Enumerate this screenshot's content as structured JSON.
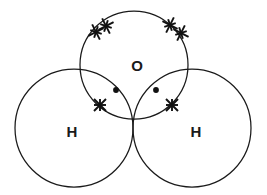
{
  "diagram": {
    "molecule": "H2O",
    "background_color": "#ffffff",
    "stroke_color": "#1a1a1a",
    "electron_color": "#111111",
    "atoms": [
      {
        "id": "oxygen",
        "label": "O",
        "cx": 134,
        "cy": 65,
        "r": 54,
        "label_x": 137,
        "label_y": 67
      },
      {
        "id": "hydrogen-left",
        "label": "H",
        "cx": 74,
        "cy": 128,
        "r": 59,
        "label_x": 72,
        "label_y": 133
      },
      {
        "id": "hydrogen-right",
        "label": "H",
        "cx": 192,
        "cy": 128,
        "r": 59,
        "label_x": 196,
        "label_y": 133
      }
    ],
    "lone_pairs": [
      {
        "id": "lone-pair-upper-left",
        "electrons": [
          {
            "type": "cross",
            "x": 96,
            "y": 32,
            "size": 6.0,
            "rotation": 18
          },
          {
            "type": "cross",
            "x": 106,
            "y": 26,
            "size": 6.0,
            "rotation": 18
          }
        ]
      },
      {
        "id": "lone-pair-upper-right",
        "electrons": [
          {
            "type": "cross",
            "x": 170,
            "y": 25,
            "size": 6.0,
            "rotation": -18
          },
          {
            "type": "cross",
            "x": 181,
            "y": 33,
            "size": 6.0,
            "rotation": -18
          }
        ]
      }
    ],
    "bonding_pairs": [
      {
        "id": "bond-pair-left",
        "electrons": [
          {
            "type": "dot",
            "x": 116,
            "y": 90,
            "size": 2.9,
            "rotation": 0
          },
          {
            "type": "cross",
            "x": 100,
            "y": 105,
            "size": 6.0,
            "rotation": 0
          }
        ]
      },
      {
        "id": "bond-pair-right",
        "electrons": [
          {
            "type": "dot",
            "x": 156,
            "y": 90,
            "size": 2.9,
            "rotation": 0
          },
          {
            "type": "cross",
            "x": 172,
            "y": 105,
            "size": 6.0,
            "rotation": 0
          }
        ]
      }
    ],
    "legend": {
      "cross_meaning": "hydrogen electron",
      "dot_meaning": "oxygen electron"
    }
  }
}
